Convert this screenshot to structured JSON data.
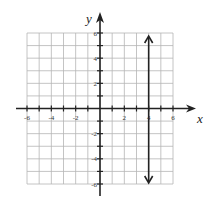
{
  "chart_data": {
    "type": "line",
    "title": "",
    "xlabel": "x",
    "ylabel": "y",
    "xlim": [
      -6,
      6
    ],
    "ylim": [
      -6,
      6
    ],
    "grid": true,
    "x_ticks": [
      -6,
      -5,
      -4,
      -3,
      -2,
      -1,
      1,
      2,
      3,
      4,
      5,
      6
    ],
    "y_ticks": [
      -6,
      -5,
      -4,
      -3,
      -2,
      -1,
      1,
      2,
      3,
      4,
      5,
      6
    ],
    "x_tick_labels": [
      "-6",
      "-4",
      "-2",
      "2",
      "4",
      "6"
    ],
    "y_tick_labels": [
      "6",
      "4",
      "2",
      "-2",
      "-4",
      "-6"
    ],
    "series": [
      {
        "name": "x = 4",
        "kind": "vertical-line",
        "x": [
          4,
          4
        ],
        "y": [
          -6,
          6
        ],
        "arrows": "both",
        "color": "#222222"
      }
    ]
  },
  "labels": {
    "x_axis": "x",
    "y_axis": "y",
    "x_ticks": [
      {
        "value": -6,
        "text": "-6"
      },
      {
        "value": -4,
        "text": "-4"
      },
      {
        "value": -2,
        "text": "-2"
      },
      {
        "value": 2,
        "text": "2"
      },
      {
        "value": 4,
        "text": "4"
      },
      {
        "value": 6,
        "text": "6"
      }
    ],
    "y_ticks": [
      {
        "value": 6,
        "text": "6"
      },
      {
        "value": 4,
        "text": "4"
      },
      {
        "value": 2,
        "text": "2"
      },
      {
        "value": -2,
        "text": "-2"
      },
      {
        "value": -4,
        "text": "-4"
      },
      {
        "value": -6,
        "text": "-6"
      }
    ]
  },
  "colors": {
    "grid": "#b5b5b5",
    "axis": "#222222",
    "line": "#222222"
  }
}
